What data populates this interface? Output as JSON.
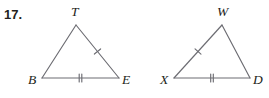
{
  "figure": {
    "problem_number": "17.",
    "stroke_color": "#6c6c72",
    "label_color": "#231f20",
    "background_color": "#ffffff",
    "triangles": [
      {
        "name": "triangle-TBE",
        "vertices": [
          {
            "label": "T",
            "role": "apex",
            "x": 76,
            "y": 25,
            "label_x": 71,
            "label_y": 16
          },
          {
            "label": "B",
            "role": "bottom-left",
            "x": 42,
            "y": 78,
            "label_x": 28,
            "label_y": 84
          },
          {
            "label": "E",
            "role": "bottom-right",
            "x": 119,
            "y": 78,
            "label_x": 122,
            "label_y": 84
          }
        ],
        "sides": [
          {
            "name": "side-TB",
            "from": "T",
            "to": "B",
            "ticks": 0
          },
          {
            "name": "side-TE",
            "from": "T",
            "to": "E",
            "ticks": 1
          },
          {
            "name": "side-BE",
            "from": "B",
            "to": "E",
            "ticks": 2
          }
        ]
      },
      {
        "name": "triangle-WXD",
        "vertices": [
          {
            "label": "W",
            "role": "apex",
            "x": 222,
            "y": 25,
            "label_x": 217,
            "label_y": 16
          },
          {
            "label": "X",
            "role": "bottom-left",
            "x": 174,
            "y": 78,
            "label_x": 160,
            "label_y": 84
          },
          {
            "label": "D",
            "role": "bottom-right",
            "x": 250,
            "y": 78,
            "label_x": 253,
            "label_y": 84
          }
        ],
        "sides": [
          {
            "name": "side-WX",
            "from": "W",
            "to": "X",
            "ticks": 1
          },
          {
            "name": "side-WD",
            "from": "W",
            "to": "D",
            "ticks": 0
          },
          {
            "name": "side-XD",
            "from": "X",
            "to": "D",
            "ticks": 2
          }
        ]
      }
    ]
  }
}
